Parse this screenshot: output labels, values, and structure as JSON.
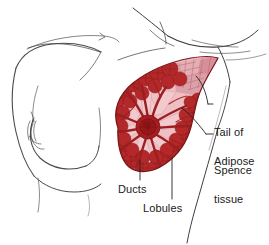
{
  "figure": {
    "background_color": "#ffffff",
    "width": 269,
    "height": 245
  },
  "labels": [
    {
      "id": "tail-of-spence",
      "text": "Tail of\nSpence",
      "line1": "Tail of",
      "line2": "Spence",
      "x": 214,
      "y": 101
    },
    {
      "id": "adipose-tissue",
      "text": "Adipose\ntissue",
      "line1": "Adipose",
      "line2": "tissue",
      "x": 214,
      "y": 130
    },
    {
      "id": "ducts",
      "text": "Ducts",
      "x": 118,
      "y": 183
    },
    {
      "id": "lobules",
      "text": "Lobules",
      "x": 143,
      "y": 202
    }
  ],
  "colors": {
    "outline": "#3a3a3a",
    "body_line": "#555555",
    "lobule_dark_red": "#a82222",
    "lobule_mid_red": "#c0392b",
    "gland_red": "#b52b2b",
    "adipose_pink": "#e8a9ae",
    "adipose_pale_pink": "#f0c3c6",
    "tail_pink": "#d9909a",
    "nipple_dark": "#9e1f1f",
    "leader_line": "#2a2a2a",
    "text": "#1a1a1a"
  },
  "anatomy_parts": [
    {
      "name": "torso-profile",
      "description": "Line drawing of female torso in profile, left side"
    },
    {
      "name": "breast-cross-section",
      "description": "Teardrop shaped breast tissue cut-away, right side"
    },
    {
      "name": "nipple-areola",
      "description": "Central dark red nipple structure"
    },
    {
      "name": "ducts",
      "description": "Radiating duct network from nipple"
    },
    {
      "name": "lobules",
      "description": "Dark red glandular lobules around periphery"
    },
    {
      "name": "adipose-tissue",
      "description": "Pale pink fatty tissue wedges"
    },
    {
      "name": "tail-of-spence",
      "description": "Upper axillary tail extension of breast tissue"
    },
    {
      "name": "axilla-contour",
      "description": "Arm and armpit contour lines, upper right"
    }
  ]
}
